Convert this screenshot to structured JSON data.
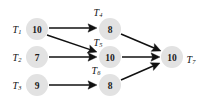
{
  "diagram": {
    "background_color": "#ffffff",
    "node_fill_color": "#e2e2e2",
    "edge_color": "#111111",
    "nodes": [
      {
        "id": "T1",
        "label": "T",
        "subscript": "1",
        "value": "10",
        "cx": 37,
        "cy": 29,
        "r": 11,
        "label_x": 17,
        "label_y": 29,
        "label_side": "left"
      },
      {
        "id": "T2",
        "label": "T",
        "subscript": "2",
        "value": "7",
        "cx": 37,
        "cy": 57,
        "r": 11,
        "label_x": 17,
        "label_y": 57,
        "label_side": "left"
      },
      {
        "id": "T3",
        "label": "T",
        "subscript": "3",
        "value": "9",
        "cx": 37,
        "cy": 85,
        "r": 11,
        "label_x": 17,
        "label_y": 85,
        "label_side": "left"
      },
      {
        "id": "T4",
        "label": "T",
        "subscript": "4",
        "value": "8",
        "cx": 110,
        "cy": 29,
        "r": 11,
        "label_x": 98,
        "label_y": 12,
        "label_side": "top"
      },
      {
        "id": "T5",
        "label": "T",
        "subscript": "5",
        "value": "10",
        "cx": 110,
        "cy": 57,
        "r": 11,
        "label_x": 98,
        "label_y": 42,
        "label_side": "top"
      },
      {
        "id": "T6",
        "label": "T",
        "subscript": "6",
        "value": "8",
        "cx": 110,
        "cy": 85,
        "r": 11,
        "label_x": 96,
        "label_y": 70,
        "label_side": "top"
      },
      {
        "id": "T7",
        "label": "T",
        "subscript": "7",
        "value": "10",
        "cx": 172,
        "cy": 57,
        "r": 11,
        "label_x": 191,
        "label_y": 59,
        "label_side": "right"
      }
    ],
    "edges": [
      {
        "from": "T1",
        "to": "T4",
        "x1": 49,
        "y1": 28,
        "x2": 97,
        "y2": 28
      },
      {
        "from": "T1",
        "to": "T5",
        "x1": 47,
        "y1": 35,
        "x2": 97,
        "y2": 52
      },
      {
        "from": "T2",
        "to": "T5",
        "x1": 49,
        "y1": 57,
        "x2": 97,
        "y2": 57
      },
      {
        "from": "T3",
        "to": "T6",
        "x1": 49,
        "y1": 85,
        "x2": 97,
        "y2": 85
      },
      {
        "from": "T4",
        "to": "T7",
        "x1": 121,
        "y1": 34,
        "x2": 161,
        "y2": 51
      },
      {
        "from": "T5",
        "to": "T7",
        "x1": 122,
        "y1": 57,
        "x2": 160,
        "y2": 57
      },
      {
        "from": "T6",
        "to": "T7",
        "x1": 121,
        "y1": 80,
        "x2": 160,
        "y2": 63
      }
    ]
  }
}
